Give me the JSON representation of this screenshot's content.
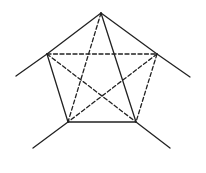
{
  "diagram": {
    "type": "pentagon-complete-graph",
    "stroke_color": "#222222",
    "background": "#ffffff",
    "vertices": {
      "top": [
        101,
        13
      ],
      "left": [
        47,
        54
      ],
      "right": [
        157,
        54
      ],
      "bottom_left": [
        68,
        122
      ],
      "bottom_right": [
        136,
        122
      ]
    },
    "solid_edges": [
      {
        "from": "top",
        "to": "left"
      },
      {
        "from": "top",
        "to": "right"
      },
      {
        "from": "left",
        "to": "bottom_left"
      },
      {
        "from": "bottom_left",
        "to": "bottom_right"
      },
      {
        "from": "top",
        "to": "bottom_right"
      }
    ],
    "dashed_edges": [
      {
        "from": "left",
        "to": "right"
      },
      {
        "from": "left",
        "to": "bottom_right"
      },
      {
        "from": "right",
        "to": "bottom_right"
      },
      {
        "from": "right",
        "to": "bottom_left"
      },
      {
        "from": "top",
        "to": "bottom_left"
      }
    ],
    "extension_rays": [
      {
        "from": "left",
        "to": [
          16,
          76
        ]
      },
      {
        "from": "right",
        "to": [
          190,
          77
        ]
      },
      {
        "from": "bottom_left",
        "to": [
          33,
          148
        ]
      },
      {
        "from": "bottom_right",
        "to": [
          170,
          148
        ]
      }
    ]
  }
}
